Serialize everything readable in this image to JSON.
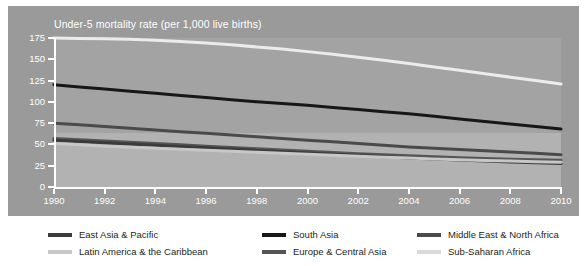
{
  "chart_data": {
    "type": "line",
    "title": "Under-5 mortality rate (per 1,000 live births)",
    "xlabel": "",
    "ylabel": "",
    "xlim": [
      1990,
      2010
    ],
    "ylim": [
      0,
      175
    ],
    "grid": false,
    "legend_position": "bottom",
    "x": [
      1990,
      1991,
      1992,
      1993,
      1994,
      1995,
      1996,
      1997,
      1998,
      1999,
      2000,
      2001,
      2002,
      2003,
      2004,
      2005,
      2006,
      2007,
      2008,
      2009,
      2010
    ],
    "xticks": [
      "1990",
      "1992",
      "1994",
      "1996",
      "1998",
      "2000",
      "2002",
      "2004",
      "2006",
      "2008",
      "2010"
    ],
    "yticks": [
      "0",
      "25",
      "50",
      "75",
      "100",
      "125",
      "150",
      "175"
    ],
    "series": [
      {
        "name": "East Asia & Pacific",
        "color": "#3b3b3b",
        "values": [
          55,
          53.5,
          52,
          50.5,
          49,
          47.5,
          46,
          44.5,
          43,
          41.5,
          40,
          38.5,
          37,
          35.5,
          34,
          32.8,
          31.6,
          30.5,
          29.4,
          28.4,
          27.5
        ]
      },
      {
        "name": "South Asia",
        "color": "#171717",
        "values": [
          120,
          117.5,
          115,
          112.5,
          110,
          107.5,
          105,
          102.5,
          100,
          98,
          96,
          93.5,
          91,
          88.5,
          86,
          83,
          80,
          77,
          74,
          71,
          68
        ]
      },
      {
        "name": "Middle East & North Africa",
        "color": "#4a4a4a",
        "values": [
          75,
          73,
          71,
          69,
          67,
          65,
          63,
          61,
          59,
          57,
          55,
          53,
          51,
          49,
          47,
          45.5,
          44,
          42.5,
          41,
          39.5,
          38
        ]
      },
      {
        "name": "Latin America & the Caribbean",
        "color": "#c7c7c7",
        "values": [
          51,
          49.5,
          48,
          46.8,
          45.6,
          44.4,
          43.2,
          42,
          40.8,
          39.6,
          38.4,
          37.2,
          36,
          35,
          34,
          33,
          32,
          31.2,
          30.4,
          29.6,
          29
        ]
      },
      {
        "name": "Europe & Central Asia",
        "color": "#555555",
        "values": [
          57,
          55.5,
          54,
          52.5,
          51,
          49.5,
          48,
          46.5,
          45,
          43.5,
          42,
          40.5,
          39,
          37.8,
          36.6,
          35.5,
          34.5,
          33.5,
          32.7,
          32,
          31.5
        ]
      },
      {
        "name": "Sub-Saharan Africa",
        "color": "#ececec",
        "values": [
          175,
          174.5,
          174,
          173.5,
          172.5,
          171,
          169,
          167,
          164.5,
          162,
          159,
          156,
          152.5,
          149,
          145,
          141,
          137,
          133,
          129,
          125,
          121
        ]
      }
    ]
  },
  "legend": {
    "rows": [
      [
        {
          "label": "East Asia & Pacific",
          "color": "#3b3b3b"
        },
        {
          "label": "South Asia",
          "color": "#171717"
        },
        {
          "label": "Middle East & North Africa",
          "color": "#4a4a4a"
        }
      ],
      [
        {
          "label": "Latin America & the Caribbean",
          "color": "#c7c7c7"
        },
        {
          "label": "Europe & Central Asia",
          "color": "#555555"
        },
        {
          "label": "Sub-Saharan Africa",
          "color": "#d9d9d9"
        }
      ]
    ]
  },
  "colors": {
    "panel_background": "#9a9a9a",
    "plot_background": "#a3a3a3",
    "plot_lower_band": "#b2b2b2",
    "axis": "#ffffff",
    "tick_text": "#ffffff",
    "legend_text": "#231f20"
  }
}
